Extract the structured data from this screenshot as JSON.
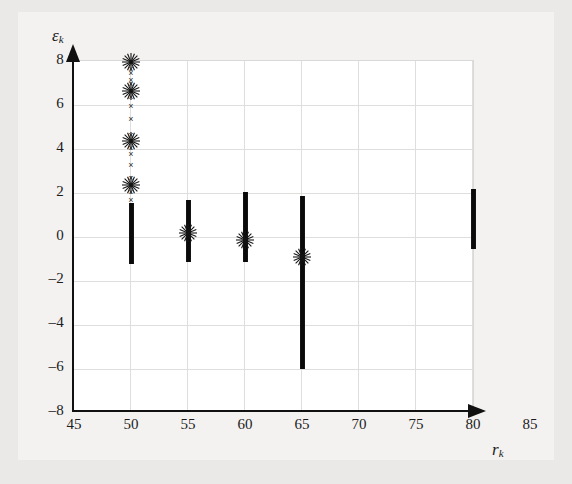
{
  "figure": {
    "kind": "scatter-plot",
    "background_color": "#ebe9e8",
    "paper_color": "#f3f2f1",
    "canvas_color": "#ffffff",
    "grid_color": "#dededd",
    "axis_color": "#111111",
    "marker_color": "#141414"
  },
  "axes": {
    "y_title": "ε",
    "y_title_sub": "k",
    "x_title": "r",
    "x_title_sub": "k",
    "x_ticks": [
      "45",
      "50",
      "55",
      "60",
      "65",
      "70",
      "75",
      "80",
      "85"
    ],
    "y_ticks": [
      "8",
      "6",
      "4",
      "2",
      "0",
      "–2",
      "–4",
      "–6",
      "–8"
    ]
  },
  "chart_data": {
    "type": "scatter",
    "title": "",
    "xlabel": "r_k",
    "ylabel": "epsilon_k",
    "xlim": [
      45,
      85
    ],
    "ylim": [
      -8,
      8
    ],
    "xticks": [
      45,
      50,
      55,
      60,
      65,
      70,
      75,
      80,
      85
    ],
    "yticks": [
      8,
      6,
      4,
      2,
      0,
      -2,
      -4,
      -6,
      -8
    ],
    "grid": true,
    "legend": "none",
    "marker": "x",
    "groups": [
      {
        "x": 50,
        "band_min": -1.3,
        "band_max": 1.5,
        "outliers": [
          1.6,
          2.0,
          2.3,
          2.6,
          3.2,
          3.7,
          4.0,
          4.3,
          4.6,
          5.3,
          5.9,
          6.3,
          6.6,
          6.9,
          7.1,
          7.4,
          7.6,
          7.9
        ],
        "bursts": [
          2.3,
          4.3,
          6.6,
          7.9
        ]
      },
      {
        "x": 55,
        "band_min": -1.2,
        "band_max": 1.6,
        "outliers": [],
        "bursts": [
          0.1
        ]
      },
      {
        "x": 60,
        "band_min": -1.2,
        "band_max": 2.0,
        "outliers": [],
        "bursts": [
          -0.2
        ]
      },
      {
        "x": 65,
        "band_min": -6.1,
        "band_max": 1.8,
        "outliers": [],
        "bursts": [
          -1.0
        ]
      },
      {
        "x": 80,
        "band_min": -0.6,
        "band_max": 2.1,
        "outliers": [],
        "bursts": []
      }
    ]
  }
}
